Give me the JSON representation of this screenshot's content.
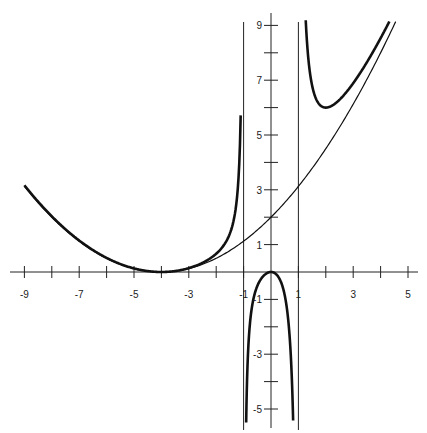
{
  "chart_data": {
    "type": "line",
    "title": "",
    "xlabel": "",
    "ylabel": "",
    "xlim": [
      -9.4,
      5.2
    ],
    "ylim": [
      -5.6,
      9.4
    ],
    "grid": false,
    "x_ticks": [
      -9,
      -8,
      -7,
      -6,
      -5,
      -4,
      -3,
      -2,
      -1,
      1,
      2,
      3,
      4,
      5
    ],
    "x_tick_labels": [
      {
        "v": -9,
        "t": "-9"
      },
      {
        "v": -7,
        "t": "-7"
      },
      {
        "v": -5,
        "t": "-5"
      },
      {
        "v": -3,
        "t": "-3"
      },
      {
        "v": -1,
        "t": "-1"
      },
      {
        "v": 1,
        "t": "1"
      },
      {
        "v": 3,
        "t": "3"
      },
      {
        "v": 5,
        "t": "5"
      }
    ],
    "y_ticks": [
      -5,
      -4,
      -3,
      -2,
      -1,
      1,
      2,
      3,
      4,
      5,
      6,
      7,
      8,
      9
    ],
    "y_tick_labels": [
      {
        "v": 9,
        "t": "9"
      },
      {
        "v": 7,
        "t": "7"
      },
      {
        "v": 5,
        "t": "5"
      },
      {
        "v": 3,
        "t": "3"
      },
      {
        "v": 1,
        "t": "1"
      },
      {
        "v": -1,
        "t": "-1"
      },
      {
        "v": -3,
        "t": "-3"
      },
      {
        "v": -5,
        "t": "-5"
      }
    ],
    "vertical_asymptotes": [
      -1,
      1
    ],
    "series": [
      {
        "name": "thin curve y=(x+4)^2/8",
        "style": "thin",
        "x": [
          -9,
          -8,
          -7,
          -6,
          -5,
          -4,
          -3,
          -2,
          -1,
          0,
          1,
          2,
          3,
          4,
          4.5
        ],
        "values": [
          3.13,
          2.0,
          1.13,
          0.5,
          0.13,
          0,
          0.13,
          0.5,
          1.13,
          2.0,
          3.13,
          4.5,
          6.13,
          8.0,
          9.03
        ]
      },
      {
        "name": "thick curve y=(x+4)^2 x^2/(8(x^2-1))",
        "style": "thick",
        "x": [
          -9,
          -8,
          -7,
          -6,
          -5,
          -4,
          -3,
          -2,
          -1.5,
          -1.1,
          -0.9,
          -0.5,
          0,
          0.5,
          0.9,
          1.1,
          1.5,
          2,
          3,
          4,
          4.3
        ],
        "values": [
          3.17,
          2.03,
          1.15,
          0.51,
          0.13,
          0,
          0.15,
          0.67,
          1.41,
          6.0,
          -4.99,
          -1.01,
          0,
          -2.02,
          -10.9,
          17.8,
          5.51,
          6.0,
          6.89,
          8.53,
          9.1
        ]
      }
    ]
  }
}
